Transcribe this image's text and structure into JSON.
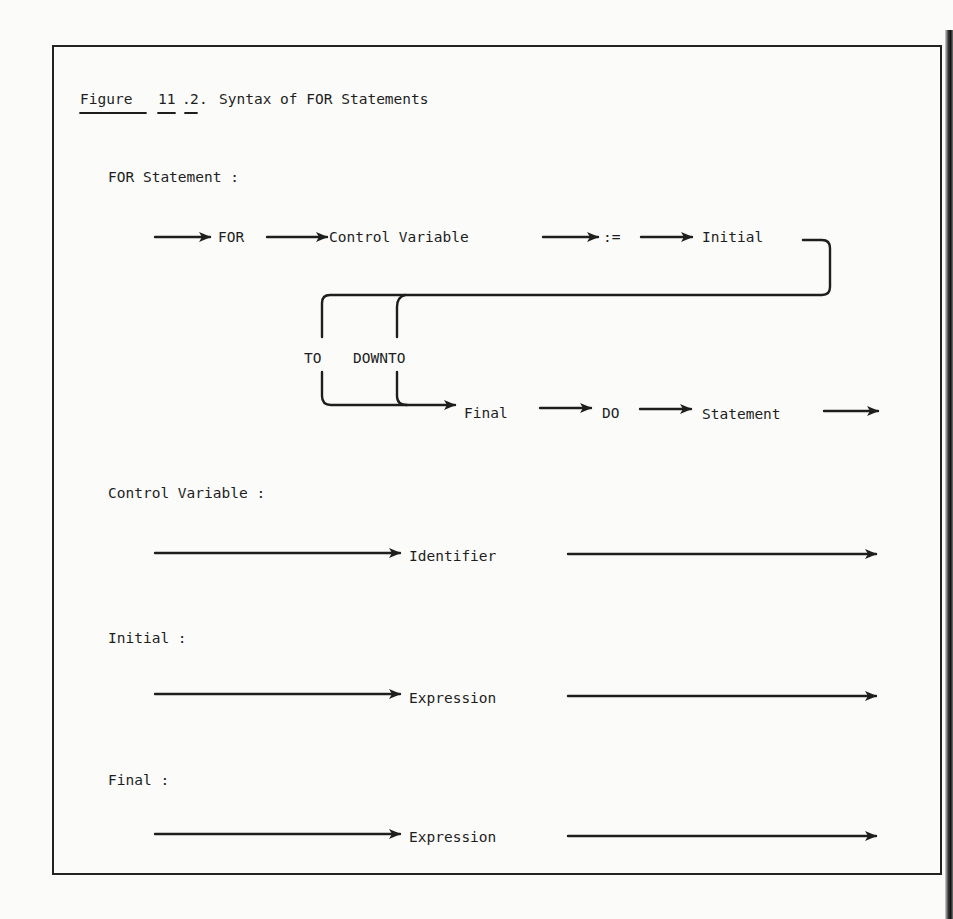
{
  "figure": {
    "number_label": "Figure",
    "number_chapter": "11",
    "number_index": "2",
    "title": "Syntax of FOR Statements"
  },
  "sections": {
    "for_statement": {
      "heading": "FOR Statement :",
      "nodes": {
        "for": "FOR",
        "control_variable": "Control Variable",
        "assign": ":=",
        "initial": "Initial",
        "to": "TO",
        "downto": "DOWNTO",
        "final": "Final",
        "do": "DO",
        "statement": "Statement"
      }
    },
    "control_variable": {
      "heading": "Control Variable :",
      "node": "Identifier"
    },
    "initial": {
      "heading": "Initial :",
      "node": "Expression"
    },
    "final": {
      "heading": "Final :",
      "node": "Expression"
    }
  }
}
